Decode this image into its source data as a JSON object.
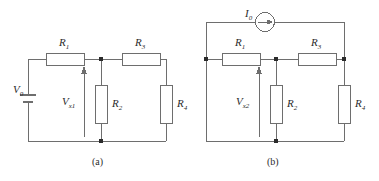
{
  "figure": {
    "type": "circuit-diagram-pair",
    "stroke_color": "#6e6e6e",
    "node_color": "#2b2b2b",
    "text_color": "#2b2b2b",
    "background": "#ffffff"
  },
  "circuit_a": {
    "caption": "(a)",
    "source": {
      "name": "battery",
      "label": "V",
      "subscript": "0"
    },
    "measured_voltage": {
      "label": "V",
      "subscript": "x1",
      "arrow_direction": "up"
    },
    "resistors": [
      {
        "label": "R",
        "subscript": "1",
        "orientation": "horizontal",
        "position": "top-left"
      },
      {
        "label": "R",
        "subscript": "3",
        "orientation": "horizontal",
        "position": "top-right"
      },
      {
        "label": "R",
        "subscript": "2",
        "orientation": "vertical",
        "position": "middle"
      },
      {
        "label": "R",
        "subscript": "4",
        "orientation": "vertical",
        "position": "right"
      }
    ]
  },
  "circuit_b": {
    "caption": "(b)",
    "source": {
      "name": "current-source",
      "label": "I",
      "subscript": "0",
      "arrow_direction": "right"
    },
    "measured_voltage": {
      "label": "V",
      "subscript": "x2",
      "arrow_direction": "up"
    },
    "resistors": [
      {
        "label": "R",
        "subscript": "1",
        "orientation": "horizontal",
        "position": "top-left"
      },
      {
        "label": "R",
        "subscript": "3",
        "orientation": "horizontal",
        "position": "top-right"
      },
      {
        "label": "R",
        "subscript": "2",
        "orientation": "vertical",
        "position": "middle"
      },
      {
        "label": "R",
        "subscript": "4",
        "orientation": "vertical",
        "position": "right"
      }
    ]
  }
}
